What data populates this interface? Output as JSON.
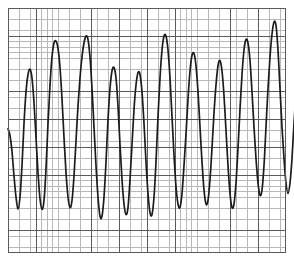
{
  "chart_data": {
    "type": "line",
    "title": "",
    "subtitle": "",
    "xlabel": "",
    "ylabel": "",
    "grid": true,
    "legend": null,
    "annotations": [],
    "xlim": [
      0,
      278
    ],
    "ylim": [
      -3.5,
      3.5
    ],
    "baseline": 0,
    "tick_labels": {
      "x": [],
      "y": []
    },
    "grid_spec": {
      "minor_spacing_px": 5.56,
      "major_spacing_px": 27.8,
      "minor_color": "#b8b8b8",
      "major_color": "#5a5a5a",
      "background": "#ffffff"
    },
    "series": [
      {
        "name": "signal",
        "color": "#1c1c1c",
        "points": [
          [
            0,
            0.05
          ],
          [
            2,
            -0.15
          ],
          [
            4,
            -0.6
          ],
          [
            6,
            -1.3
          ],
          [
            8,
            -1.9
          ],
          [
            10,
            -2.25
          ],
          [
            12,
            -1.9
          ],
          [
            14,
            -1.0
          ],
          [
            16,
            0.2
          ],
          [
            18,
            1.1
          ],
          [
            20,
            1.6
          ],
          [
            22,
            1.75
          ],
          [
            24,
            1.5
          ],
          [
            26,
            0.8
          ],
          [
            28,
            -0.2
          ],
          [
            30,
            -1.2
          ],
          [
            32,
            -1.95
          ],
          [
            34,
            -2.25
          ],
          [
            36,
            -2.0
          ],
          [
            38,
            -1.1
          ],
          [
            40,
            0.2
          ],
          [
            42,
            1.3
          ],
          [
            44,
            2.1
          ],
          [
            46,
            2.5
          ],
          [
            48,
            2.55
          ],
          [
            50,
            2.35
          ],
          [
            52,
            1.8
          ],
          [
            54,
            0.9
          ],
          [
            56,
            -0.2
          ],
          [
            58,
            -1.2
          ],
          [
            60,
            -1.9
          ],
          [
            62,
            -2.2
          ],
          [
            64,
            -2.0
          ],
          [
            66,
            -1.3
          ],
          [
            68,
            -0.3
          ],
          [
            70,
            0.7
          ],
          [
            72,
            1.5
          ],
          [
            74,
            2.1
          ],
          [
            76,
            2.5
          ],
          [
            78,
            2.7
          ],
          [
            80,
            2.6
          ],
          [
            82,
            2.1
          ],
          [
            84,
            1.2
          ],
          [
            86,
            0.1
          ],
          [
            88,
            -1.0
          ],
          [
            90,
            -1.9
          ],
          [
            92,
            -2.45
          ],
          [
            94,
            -2.45
          ],
          [
            96,
            -1.9
          ],
          [
            98,
            -0.9
          ],
          [
            100,
            0.3
          ],
          [
            102,
            1.2
          ],
          [
            104,
            1.7
          ],
          [
            106,
            1.8
          ],
          [
            108,
            1.5
          ],
          [
            110,
            0.7
          ],
          [
            112,
            -0.4
          ],
          [
            114,
            -1.4
          ],
          [
            116,
            -2.1
          ],
          [
            118,
            -2.4
          ],
          [
            120,
            -2.2
          ],
          [
            122,
            -1.4
          ],
          [
            124,
            -0.4
          ],
          [
            126,
            0.6
          ],
          [
            128,
            1.3
          ],
          [
            130,
            1.65
          ],
          [
            132,
            1.6
          ],
          [
            134,
            1.1
          ],
          [
            136,
            0.2
          ],
          [
            138,
            -0.9
          ],
          [
            140,
            -1.8
          ],
          [
            142,
            -2.35
          ],
          [
            144,
            -2.4
          ],
          [
            146,
            -1.9
          ],
          [
            148,
            -0.9
          ],
          [
            150,
            0.4
          ],
          [
            152,
            1.5
          ],
          [
            154,
            2.3
          ],
          [
            156,
            2.7
          ],
          [
            158,
            2.7
          ],
          [
            160,
            2.3
          ],
          [
            162,
            1.5
          ],
          [
            164,
            0.4
          ],
          [
            166,
            -0.7
          ],
          [
            168,
            -1.6
          ],
          [
            170,
            -2.1
          ],
          [
            172,
            -2.2
          ],
          [
            174,
            -1.8
          ],
          [
            176,
            -1.0
          ],
          [
            178,
            -0.1
          ],
          [
            180,
            0.9
          ],
          [
            182,
            1.7
          ],
          [
            184,
            2.15
          ],
          [
            186,
            2.2
          ],
          [
            188,
            1.85
          ],
          [
            190,
            1.1
          ],
          [
            192,
            0.1
          ],
          [
            194,
            -0.9
          ],
          [
            196,
            -1.7
          ],
          [
            198,
            -2.1
          ],
          [
            200,
            -2.0
          ],
          [
            202,
            -1.4
          ],
          [
            204,
            -0.5
          ],
          [
            206,
            0.5
          ],
          [
            208,
            1.3
          ],
          [
            210,
            1.85
          ],
          [
            212,
            2.0
          ],
          [
            214,
            1.7
          ],
          [
            216,
            1.0
          ],
          [
            218,
            0.0
          ],
          [
            220,
            -1.0
          ],
          [
            222,
            -1.8
          ],
          [
            224,
            -2.2
          ],
          [
            226,
            -2.1
          ],
          [
            228,
            -1.5
          ],
          [
            230,
            -0.5
          ],
          [
            232,
            0.6
          ],
          [
            234,
            1.6
          ],
          [
            236,
            2.3
          ],
          [
            238,
            2.6
          ],
          [
            240,
            2.5
          ],
          [
            242,
            2.0
          ],
          [
            244,
            1.1
          ],
          [
            246,
            0.1
          ],
          [
            248,
            -0.8
          ],
          [
            250,
            -1.5
          ],
          [
            252,
            -1.85
          ],
          [
            254,
            -1.7
          ],
          [
            256,
            -1.0
          ],
          [
            258,
            0.1
          ],
          [
            260,
            1.2
          ],
          [
            262,
            2.1
          ],
          [
            264,
            2.75
          ],
          [
            266,
            3.1
          ],
          [
            268,
            3.0
          ],
          [
            270,
            2.3
          ],
          [
            272,
            1.2
          ],
          [
            274,
            0.1
          ],
          [
            276,
            -0.8
          ],
          [
            278,
            -1.5
          ],
          [
            280,
            -1.8
          ],
          [
            282,
            -1.5
          ],
          [
            284,
            -0.8
          ],
          [
            286,
            0.2
          ],
          [
            288,
            1.1
          ],
          [
            290,
            1.85
          ],
          [
            292,
            2.25
          ],
          [
            294,
            2.2
          ],
          [
            296,
            1.7
          ],
          [
            298,
            0.8
          ],
          [
            300,
            -0.2
          ],
          [
            302,
            -1.1
          ],
          [
            304,
            -1.7
          ],
          [
            306,
            -1.85
          ],
          [
            308,
            -1.5
          ],
          [
            310,
            -0.8
          ],
          [
            312,
            0.0
          ],
          [
            314,
            0.4
          ],
          [
            316,
            0.3
          ],
          [
            318,
            0.1
          ],
          [
            320,
            0.05
          ]
        ]
      }
    ]
  }
}
